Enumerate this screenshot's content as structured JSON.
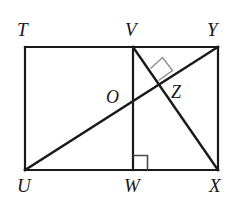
{
  "figure": {
    "kind": "plane-geometry-diagram",
    "stroke_color": "#1a1a1a",
    "accent_stroke_color": "#8a8a8a",
    "background_color": "#ffffff",
    "stroke_width": 2.2,
    "marker_stroke_width": 1.4,
    "vertices": [
      {
        "id": "T",
        "label": "T",
        "x": 25,
        "y": 47,
        "role": "rectangle-corner-top-left"
      },
      {
        "id": "V",
        "label": "V",
        "x": 133,
        "y": 47,
        "role": "top-edge-point"
      },
      {
        "id": "Y",
        "label": "Y",
        "x": 218,
        "y": 47,
        "role": "rectangle-corner-top-right"
      },
      {
        "id": "U",
        "label": "U",
        "x": 25,
        "y": 170,
        "role": "rectangle-corner-bottom-left"
      },
      {
        "id": "W",
        "label": "W",
        "x": 133,
        "y": 170,
        "role": "bottom-edge-point"
      },
      {
        "id": "X",
        "label": "X",
        "x": 218,
        "y": 170,
        "role": "rectangle-corner-bottom-right"
      },
      {
        "id": "O",
        "label": "O",
        "x": 133,
        "y": 108,
        "role": "intersection-UY-with-VW"
      },
      {
        "id": "Z",
        "label": "Z",
        "x": 158,
        "y": 88,
        "role": "intersection-UY-with-VX"
      }
    ],
    "segments": [
      {
        "id": "TY",
        "from": "T",
        "to": "Y",
        "name": "top-edge-TY"
      },
      {
        "id": "YX",
        "from": "Y",
        "to": "X",
        "name": "right-edge-YX"
      },
      {
        "id": "XU",
        "from": "X",
        "to": "U",
        "name": "bottom-edge-XU"
      },
      {
        "id": "UT",
        "from": "U",
        "to": "T",
        "name": "left-edge-UT"
      },
      {
        "id": "VW",
        "from": "V",
        "to": "W",
        "name": "vertical-segment-VW"
      },
      {
        "id": "UY",
        "from": "U",
        "to": "Y",
        "name": "diagonal-UY"
      },
      {
        "id": "VX",
        "from": "V",
        "to": "X",
        "name": "diagonal-VX"
      }
    ],
    "right_angle_markers": [
      {
        "id": "angle-at-Z",
        "at": "Z",
        "label": "right-angle-at-Z",
        "style": "rotated-square"
      },
      {
        "id": "angle-at-W",
        "at": "W",
        "label": "right-angle-at-W",
        "style": "axis-aligned-square"
      }
    ]
  }
}
